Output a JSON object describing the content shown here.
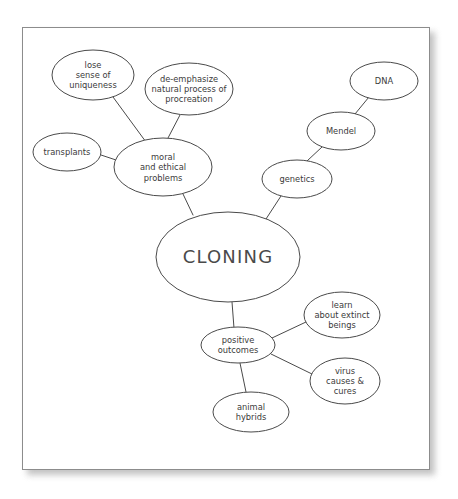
{
  "document": {
    "title": "Cloning Concept Map",
    "type": "hand-drawn concept map on paper",
    "paper": {
      "x": 22,
      "y": 27,
      "width": 408,
      "height": 443,
      "border_color": "#8c8c8c",
      "fill": "#ffffff"
    },
    "background_color": "#ffffff",
    "ink_color": "#4a4a4a"
  },
  "map": {
    "nodes": [
      {
        "id": "cloning",
        "name": "node-cloning",
        "label": "CLONING",
        "lines": [
          "CLONING"
        ],
        "role": "central-topic",
        "cx": 228,
        "cy": 257,
        "rx": 72,
        "ry": 45,
        "font_size": 18,
        "line_height": 20
      },
      {
        "id": "moral-problems",
        "name": "node-moral-and-ethical-problems",
        "label": "moral and ethical problems",
        "lines": [
          "moral",
          "and ethical",
          "problems"
        ],
        "role": "branch",
        "cx": 163,
        "cy": 167,
        "rx": 49,
        "ry": 29,
        "font_size": 9,
        "line_height": 10.5
      },
      {
        "id": "lose-uniqueness",
        "name": "node-lose-sense-of-uniqueness",
        "label": "lose sense of uniqueness",
        "lines": [
          "lose",
          "sense of",
          "uniqueness"
        ],
        "role": "sub-branch",
        "cx": 93,
        "cy": 75,
        "rx": 41,
        "ry": 25,
        "font_size": 8.6,
        "line_height": 10
      },
      {
        "id": "de-emphasize",
        "name": "node-de-emphasize-natural-process-of-procreation",
        "label": "de-emphasize natural process of procreation",
        "lines": [
          "de-emphasize",
          "natural process of",
          "procreation"
        ],
        "role": "sub-branch",
        "cx": 189,
        "cy": 89,
        "rx": 44,
        "ry": 26,
        "font_size": 8.3,
        "line_height": 9.6
      },
      {
        "id": "transplants",
        "name": "node-transplants",
        "label": "transplants",
        "lines": [
          "transplants"
        ],
        "role": "sub-branch",
        "cx": 67,
        "cy": 152,
        "rx": 34,
        "ry": 19,
        "font_size": 9,
        "line_height": 10
      },
      {
        "id": "genetics",
        "name": "node-genetics",
        "label": "genetics",
        "lines": [
          "genetics"
        ],
        "role": "branch",
        "cx": 297,
        "cy": 179,
        "rx": 35,
        "ry": 19,
        "font_size": 9,
        "line_height": 10
      },
      {
        "id": "mendel",
        "name": "node-mendel",
        "label": "Mendel",
        "lines": [
          "Mendel"
        ],
        "role": "sub-branch",
        "cx": 341,
        "cy": 131,
        "rx": 34,
        "ry": 19,
        "font_size": 9.4,
        "line_height": 10
      },
      {
        "id": "dna",
        "name": "node-dna",
        "label": "DNA",
        "lines": [
          "DNA"
        ],
        "role": "sub-branch",
        "cx": 384,
        "cy": 81,
        "rx": 34,
        "ry": 19,
        "font_size": 9.4,
        "line_height": 10
      },
      {
        "id": "positive-outcomes",
        "name": "node-positive-outcomes",
        "label": "positive outcomes",
        "lines": [
          "positive",
          "outcomes"
        ],
        "role": "branch",
        "cx": 238,
        "cy": 345,
        "rx": 37,
        "ry": 18,
        "font_size": 8.6,
        "line_height": 10
      },
      {
        "id": "extinct-beings",
        "name": "node-learn-about-extinct-beings",
        "label": "learn about extinct beings",
        "lines": [
          "learn",
          "about extinct",
          "beings"
        ],
        "role": "sub-branch",
        "cx": 342,
        "cy": 315,
        "rx": 38,
        "ry": 23,
        "font_size": 8.3,
        "line_height": 9.6
      },
      {
        "id": "virus-cures",
        "name": "node-virus-causes-and-cures",
        "label": "virus causes & cures",
        "lines": [
          "virus",
          "causes &",
          "cures"
        ],
        "role": "sub-branch",
        "cx": 345,
        "cy": 381,
        "rx": 35,
        "ry": 23,
        "font_size": 8.3,
        "line_height": 9.6
      },
      {
        "id": "animal-hybrids",
        "name": "node-animal-hybrids",
        "label": "animal hybrids",
        "lines": [
          "animal",
          "hybrids"
        ],
        "role": "sub-branch",
        "cx": 251,
        "cy": 412,
        "rx": 38,
        "ry": 20,
        "font_size": 8.6,
        "line_height": 10
      }
    ],
    "edges": [
      {
        "name": "edge-moral-problems-to-cloning",
        "from": "moral-problems",
        "to": "cloning",
        "x1": 183,
        "y1": 194,
        "x2": 193,
        "y2": 215
      },
      {
        "name": "edge-lose-uniqueness-to-moral-problems",
        "from": "lose-uniqueness",
        "to": "moral-problems",
        "x1": 113,
        "y1": 97,
        "x2": 146,
        "y2": 142
      },
      {
        "name": "edge-de-emphasize-to-moral-problems",
        "from": "de-emphasize",
        "to": "moral-problems",
        "x1": 180,
        "y1": 115,
        "x2": 168,
        "y2": 138
      },
      {
        "name": "edge-transplants-to-moral-problems",
        "from": "transplants",
        "to": "moral-problems",
        "x1": 101,
        "y1": 155,
        "x2": 116,
        "y2": 160
      },
      {
        "name": "edge-genetics-to-cloning",
        "from": "genetics",
        "to": "cloning",
        "x1": 281,
        "y1": 196,
        "x2": 266,
        "y2": 219
      },
      {
        "name": "edge-mendel-to-genetics",
        "from": "mendel",
        "to": "genetics",
        "x1": 322,
        "y1": 147,
        "x2": 307,
        "y2": 161
      },
      {
        "name": "edge-dna-to-mendel",
        "from": "dna",
        "to": "mendel",
        "x1": 369,
        "y1": 97,
        "x2": 355,
        "y2": 114
      },
      {
        "name": "edge-cloning-to-positive-outcomes",
        "from": "cloning",
        "to": "positive-outcomes",
        "x1": 232,
        "y1": 302,
        "x2": 234,
        "y2": 328
      },
      {
        "name": "edge-positive-outcomes-to-extinct-beings",
        "from": "positive-outcomes",
        "to": "extinct-beings",
        "x1": 272,
        "y1": 338,
        "x2": 306,
        "y2": 322
      },
      {
        "name": "edge-positive-outcomes-to-virus-cures",
        "from": "positive-outcomes",
        "to": "virus-cures",
        "x1": 271,
        "y1": 354,
        "x2": 312,
        "y2": 374
      },
      {
        "name": "edge-positive-outcomes-to-animal-hybrids",
        "from": "positive-outcomes",
        "to": "animal-hybrids",
        "x1": 240,
        "y1": 363,
        "x2": 246,
        "y2": 392
      }
    ]
  }
}
